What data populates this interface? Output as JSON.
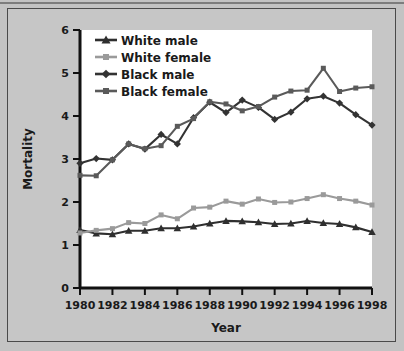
{
  "figure": {
    "background_color": "#c3c3c3",
    "plot_background_color": "#ffffff",
    "frame_color": "#4a4a4a"
  },
  "chart_data": {
    "type": "line",
    "title": "",
    "xlabel": "Year",
    "ylabel": "Mortality",
    "xlim": [
      1980,
      1998
    ],
    "ylim": [
      0,
      6
    ],
    "xticks": [
      1980,
      1982,
      1984,
      1986,
      1988,
      1990,
      1992,
      1994,
      1996,
      1998
    ],
    "yticks": [
      0,
      1,
      2,
      3,
      4,
      5,
      6
    ],
    "grid": false,
    "legend_position": "top-left",
    "x": [
      1980,
      1981,
      1982,
      1983,
      1984,
      1985,
      1986,
      1987,
      1988,
      1989,
      1990,
      1991,
      1992,
      1993,
      1994,
      1995,
      1996,
      1997,
      1998
    ],
    "series": [
      {
        "name": "White male",
        "color": "#2f2f2f",
        "marker": "triangle",
        "values": [
          1.35,
          1.27,
          1.25,
          1.33,
          1.33,
          1.39,
          1.39,
          1.43,
          1.5,
          1.56,
          1.55,
          1.53,
          1.49,
          1.5,
          1.56,
          1.51,
          1.49,
          1.41,
          1.3
        ]
      },
      {
        "name": "White female",
        "color": "#9a9a9a",
        "marker": "square",
        "values": [
          1.28,
          1.34,
          1.38,
          1.52,
          1.5,
          1.7,
          1.61,
          1.86,
          1.88,
          2.02,
          1.95,
          2.07,
          1.99,
          2.0,
          2.08,
          2.17,
          2.08,
          2.02,
          1.93
        ]
      },
      {
        "name": "Black male",
        "color": "#333333",
        "marker": "diamond",
        "values": [
          2.9,
          3.01,
          2.98,
          3.35,
          3.23,
          3.57,
          3.35,
          3.96,
          4.32,
          4.08,
          4.37,
          4.2,
          3.92,
          4.09,
          4.4,
          4.46,
          4.3,
          4.03,
          3.79
        ]
      },
      {
        "name": "Black female",
        "color": "#5a5a5a",
        "marker": "square",
        "values": [
          2.62,
          2.61,
          2.98,
          3.35,
          3.24,
          3.31,
          3.76,
          3.94,
          4.33,
          4.28,
          4.12,
          4.22,
          4.44,
          4.58,
          4.6,
          5.11,
          4.57,
          4.65,
          4.68
        ]
      }
    ]
  }
}
